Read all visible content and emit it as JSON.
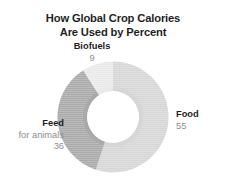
{
  "chart_data": {
    "type": "pie",
    "variant": "donut",
    "title": "How Global Crop Calories Are Used by Percent",
    "title_lines": [
      "How Global Crop Calories",
      "Are Used by Percent"
    ],
    "xlabel": "",
    "ylabel": "",
    "units": "percent",
    "total": 100,
    "legend_position": "none",
    "grid": false,
    "labels_on_slices": true,
    "categories": [
      "Food",
      "Feed for animals",
      "Biofuels"
    ],
    "values": [
      55,
      36,
      9
    ],
    "slices": [
      {
        "name": "Food",
        "sublabel": "",
        "value": 55,
        "value_text": "55",
        "color": "#d6d6d6",
        "start_angle_deg": 0,
        "end_angle_deg": 198,
        "label_position": "right"
      },
      {
        "name": "Feed",
        "sublabel": "for animals",
        "value": 36,
        "value_text": "36",
        "color": "#a9a9a9",
        "start_angle_deg": 198,
        "end_angle_deg": 327.6,
        "label_position": "left"
      },
      {
        "name": "Biofuels",
        "sublabel": "",
        "value": 9,
        "value_text": "9",
        "color": "#e9e9e9",
        "start_angle_deg": 327.6,
        "end_angle_deg": 360,
        "label_position": "top"
      }
    ],
    "colors": {
      "food": "#d6d6d6",
      "feed": "#a9a9a9",
      "biofuels": "#e9e9e9",
      "background": "#ffffff",
      "title_text": "#1f1f1f",
      "label_text": "#1f1f1f",
      "value_text": "#8d8d8d"
    }
  }
}
